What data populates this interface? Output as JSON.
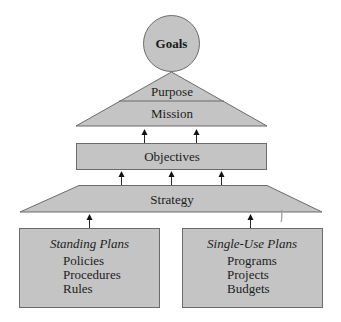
{
  "diagram": {
    "goals": {
      "label": "Goals"
    },
    "pyramid": {
      "top_label": "Purpose",
      "bottom_label": "Mission"
    },
    "objectives": {
      "label": "Objectives"
    },
    "strategy": {
      "label": "Strategy"
    },
    "standing_plans": {
      "title": "Standing Plans",
      "items": [
        "Policies",
        "Procedures",
        "Rules"
      ]
    },
    "single_use_plans": {
      "title": "Single-Use Plans",
      "items": [
        "Programs",
        "Projects",
        "Budgets"
      ]
    },
    "colors": {
      "shape_fill": "#c4c4c4",
      "shape_stroke": "#6b6b6b",
      "text": "#1c1c1c",
      "arrow": "#111111",
      "background": "#ffffff"
    }
  }
}
